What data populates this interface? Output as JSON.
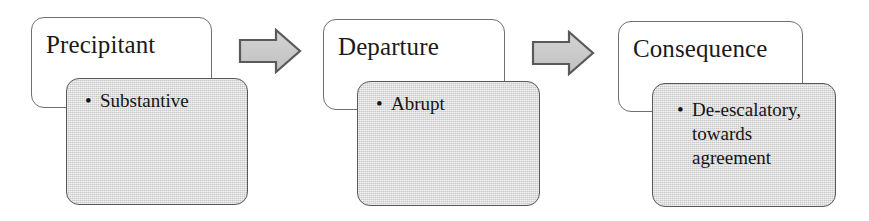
{
  "diagram": {
    "type": "process-flow",
    "orientation": "left-to-right",
    "stage_count": 3,
    "colors": {
      "title_card_fill": "#ffffff",
      "title_card_border": "#6f6f6f",
      "detail_card_fill": "#d7d7d7",
      "detail_card_border": "#585858",
      "arrow_fill": "#c9c9c9",
      "arrow_border": "#5a5a5a",
      "text": "#141414",
      "background": "#ffffff"
    },
    "stages": [
      {
        "id": "precipitant",
        "title": "Precipitant",
        "bullets": [
          "Substantive"
        ]
      },
      {
        "id": "departure",
        "title": "Departure",
        "bullets": [
          "Abrupt"
        ]
      },
      {
        "id": "consequence",
        "title": "Consequence",
        "bullets": [
          "De-escalatory, towards agreement"
        ]
      }
    ],
    "connectors": [
      {
        "id": "arrow-1",
        "icon": "right-block-arrow-icon",
        "from": "precipitant",
        "to": "departure"
      },
      {
        "id": "arrow-2",
        "icon": "right-block-arrow-icon",
        "from": "departure",
        "to": "consequence"
      }
    ],
    "bullet_glyph": "•"
  }
}
